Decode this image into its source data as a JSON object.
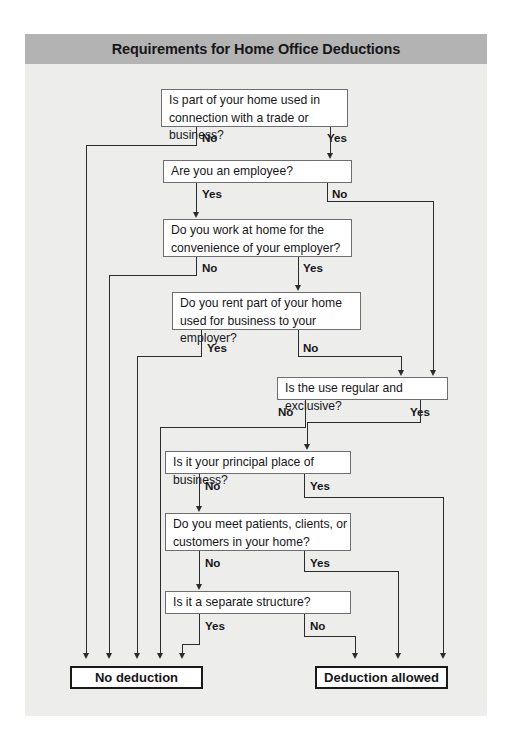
{
  "title": "Requirements for Home Office Deductions",
  "nodes": {
    "q1": "Is part of your home used in connection with a trade or business?",
    "q2": "Are you an employee?",
    "q3": "Do you work at home for the convenience of your employer?",
    "q4": "Do you rent part of your home used for business to your employer?",
    "q5": "Is the use regular and exclusive?",
    "q6": "Is it your principal place of business?",
    "q7": "Do you meet patients, clients, or customers in your home?",
    "q8": "Is it a separate structure?",
    "no_deduction": "No deduction",
    "deduction_allowed": "Deduction allowed"
  },
  "labels": {
    "q1_no": "No",
    "q1_yes": "Yes",
    "q2_yes": "Yes",
    "q2_no": "No",
    "q3_no": "No",
    "q3_yes": "Yes",
    "q4_yes": "Yes",
    "q4_no": "No",
    "q5_no": "No",
    "q5_yes": "Yes",
    "q6_no": "No",
    "q6_yes": "Yes",
    "q7_no": "No",
    "q7_yes": "Yes",
    "q8_yes": "Yes",
    "q8_no": "No"
  },
  "colors": {
    "title_band": "#b3b3b3",
    "page_background": "#ededec",
    "node_border": "#6e6e70",
    "terminal_border": "#1a1a1a",
    "connector": "#2b2b2d",
    "text": "#17161a"
  }
}
